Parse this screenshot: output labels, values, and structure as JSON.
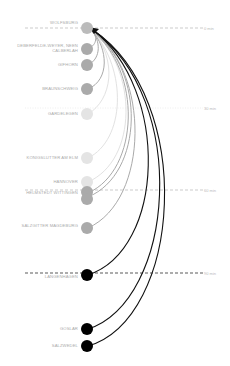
{
  "diagram": {
    "target": "WOLFSBURG",
    "time_lines": [
      {
        "label": "0 min",
        "y": 28,
        "style": "dashed-gray"
      },
      {
        "label": "30 min",
        "y": 108,
        "style": "dotted-lightgray"
      },
      {
        "label": "60 min",
        "y": 190,
        "style": "dashed-gray"
      },
      {
        "label": "90 min",
        "y": 273,
        "style": "dashed-black"
      }
    ],
    "nodes": [
      {
        "name": "WOLFSBURG",
        "y": 28,
        "color": "#bbbbbb"
      },
      {
        "name": "DEBERFELDE-WEYER, NEEN CALBERLAH",
        "y": 49,
        "color": "#aaaaaa"
      },
      {
        "name": "GIFHORN",
        "y": 65,
        "color": "#aaaaaa"
      },
      {
        "name": "BRAUNSCHWEIG",
        "y": 89,
        "color": "#aaaaaa"
      },
      {
        "name": "GARDELEGEN",
        "y": 114,
        "color": "#e4e4e4"
      },
      {
        "name": "KÖNIGSLUTTER AM ELM",
        "y": 158,
        "color": "#e4e4e4"
      },
      {
        "name": "HANNOVER",
        "y": 182,
        "color": "#e4e4e4"
      },
      {
        "name": "HELMSTEDT WITTINGEN",
        "y": 196,
        "color": "#aaaaaa"
      },
      {
        "name": "SALZGITTER MAGDEBURG",
        "y": 228,
        "color": "#aaaaaa"
      },
      {
        "name": "LANGENHAGEN",
        "y": 275,
        "color": "#000000"
      },
      {
        "name": "GOSLAR",
        "y": 329,
        "color": "#000000"
      },
      {
        "name": "SALZWEDEL",
        "y": 346,
        "color": "#000000"
      }
    ]
  }
}
